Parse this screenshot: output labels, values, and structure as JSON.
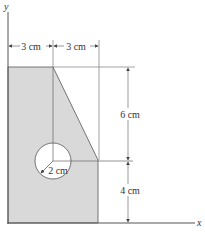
{
  "diagram": {
    "type": "composite area with circular hole",
    "axes": {
      "x_label": "x",
      "y_label": "y"
    },
    "dimensions": {
      "top_left_width": "3 cm",
      "top_right_width": "3 cm",
      "upper_height": "6 cm",
      "lower_height": "4 cm",
      "hole_radius": "2 cm"
    },
    "colors": {
      "fill": "#d9d9d9",
      "stroke": "#555555",
      "dim_line": "#666666",
      "hole": "#ffffff"
    }
  }
}
